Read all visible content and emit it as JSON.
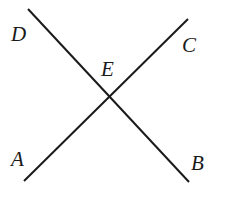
{
  "diagram": {
    "type": "intersecting-lines",
    "lines": [
      {
        "name": "DB",
        "from": "D",
        "to": "B",
        "x1": 28,
        "y1": 9,
        "x2": 189,
        "y2": 182
      },
      {
        "name": "AC",
        "from": "A",
        "to": "C",
        "x1": 24,
        "y1": 181,
        "x2": 188,
        "y2": 19
      }
    ],
    "intersection": {
      "label": "E",
      "x": 108,
      "y": 97
    },
    "labels": {
      "D": {
        "text": "D",
        "x": 11,
        "y": 41
      },
      "C": {
        "text": "C",
        "x": 182,
        "y": 52
      },
      "E": {
        "text": "E",
        "x": 101,
        "y": 76
      },
      "A": {
        "text": "A",
        "x": 11,
        "y": 166
      },
      "B": {
        "text": "B",
        "x": 191,
        "y": 170
      }
    },
    "stroke_color": "#1a1a1a"
  }
}
